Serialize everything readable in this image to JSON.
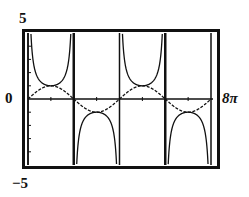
{
  "chart_data": {
    "type": "line",
    "title": "",
    "xlabel": "",
    "ylabel": "",
    "xlim": [
      0,
      25.1327
    ],
    "ylim": [
      -5,
      5
    ],
    "xlim_labels": [
      "0",
      "8π"
    ],
    "ylim_labels": [
      "-5",
      "5"
    ],
    "x_tick_step": 3.14159,
    "y_tick_step": 1,
    "grid": false,
    "legend": null,
    "asymptotes_x": [
      0,
      6.28319,
      12.56637,
      18.84956,
      25.13274
    ],
    "series": [
      {
        "name": "y = csc(x/2)",
        "function": "1/sin(x/2)",
        "style": "solid",
        "x": [
          0.3,
          0.785,
          1.571,
          3.142,
          4.712,
          5.498,
          5.98,
          6.58,
          7.07,
          7.854,
          9.425,
          10.996,
          11.78,
          12.27,
          12.87,
          13.35,
          14.137,
          15.708,
          17.279,
          18.06,
          18.55,
          19.15,
          19.63,
          20.42,
          21.99,
          23.56,
          24.35,
          24.83
        ],
        "values": [
          6.69,
          2.61,
          1.41,
          1.0,
          1.41,
          2.61,
          6.69,
          -6.69,
          -2.61,
          -1.41,
          -1.0,
          -1.41,
          -2.61,
          -6.69,
          6.69,
          2.61,
          1.41,
          1.0,
          1.41,
          2.61,
          6.69,
          -6.69,
          -2.61,
          -1.41,
          -1.0,
          -1.41,
          -2.61,
          -6.69
        ]
      },
      {
        "name": "y = sin(x/2)",
        "function": "sin(x/2)",
        "style": "dashed",
        "x": [
          0,
          1.571,
          3.142,
          4.712,
          6.283,
          7.854,
          9.425,
          10.996,
          12.566,
          14.137,
          15.708,
          17.279,
          18.85,
          20.42,
          21.991,
          23.562,
          25.133
        ],
        "values": [
          0,
          0.707,
          1.0,
          0.707,
          0,
          -0.707,
          -1.0,
          -0.707,
          0,
          0.707,
          1.0,
          0.707,
          0,
          -0.707,
          -1.0,
          -0.707,
          0
        ]
      }
    ]
  },
  "labels": {
    "ymax": "5",
    "origin": "0",
    "ymin": "−5",
    "xmax": "8π"
  },
  "colors": {
    "ink": "#111111",
    "background": "#ffffff"
  }
}
